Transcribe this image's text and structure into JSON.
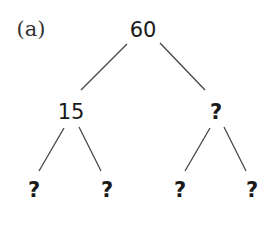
{
  "label": "(a)",
  "tree": {
    "root": "60",
    "left": {
      "value": "15",
      "children": [
        "?",
        "?"
      ]
    },
    "right": {
      "value": "?",
      "children": [
        "?",
        "?"
      ]
    }
  },
  "colors": {
    "text": "#1a1a1a",
    "line": "#444444",
    "background": "#ffffff"
  }
}
